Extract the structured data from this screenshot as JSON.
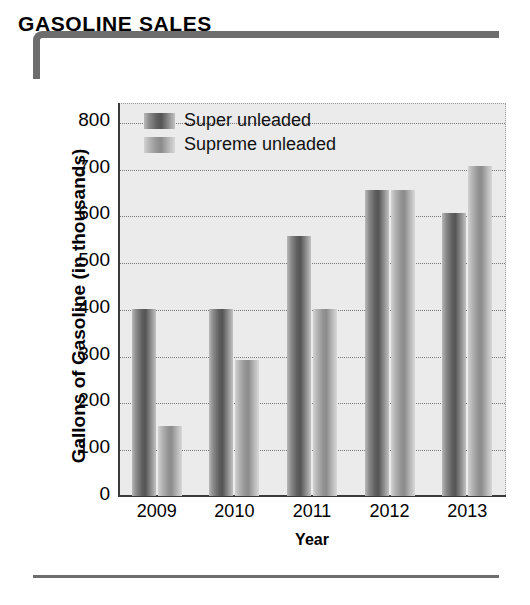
{
  "title": "GASOLINE SALES",
  "chart_data": {
    "type": "bar",
    "title": "GASOLINE SALES",
    "categories": [
      "2009",
      "2010",
      "2011",
      "2012",
      "2013"
    ],
    "series": [
      {
        "name": "Super unleaded",
        "values": [
          400,
          400,
          555,
          655,
          605
        ],
        "color": "#5f5f5f"
      },
      {
        "name": "Supreme unleaded",
        "values": [
          150,
          290,
          400,
          655,
          705
        ],
        "color": "#939393"
      }
    ],
    "xlabel": "Year",
    "ylabel": "Gallons of Gasoline (in thousands)",
    "ylim": [
      0,
      840
    ],
    "yticks": [
      0,
      100,
      200,
      300,
      400,
      500,
      600,
      700,
      800
    ],
    "ytick_labels": [
      "0",
      "100",
      "200",
      "300",
      "400",
      "500",
      "600",
      "700",
      "800"
    ],
    "grid": true,
    "legend_position": "top-left",
    "plot_background": "#ebebeb"
  },
  "colors": {
    "accent": "#6d6d6d",
    "plot_bg": "#ebebeb",
    "grid": "#777777",
    "axis": "#3a3a3a",
    "super": "#5f5f5f",
    "supreme": "#939393"
  }
}
